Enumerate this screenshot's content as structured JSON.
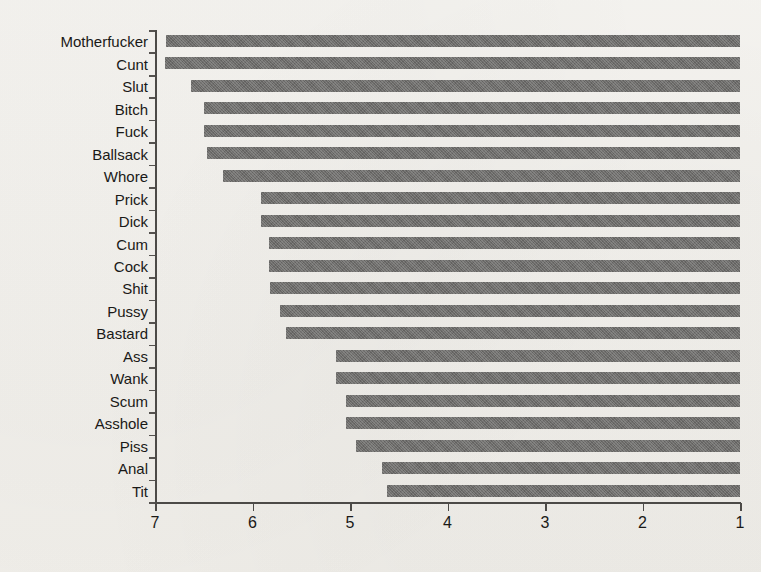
{
  "chart_data": {
    "type": "bar",
    "orientation": "horizontal",
    "title": "",
    "xlabel": "",
    "ylabel": "",
    "xlim": [
      7,
      1
    ],
    "x_ticks": [
      "7",
      "6",
      "5",
      "4",
      "3",
      "2",
      "1"
    ],
    "x_tick_values": [
      7,
      6,
      5,
      4,
      3,
      2,
      1
    ],
    "axis_reversed": true,
    "grid": false,
    "legend": false,
    "bar_baseline": 1,
    "categories": [
      "Motherfucker",
      "Cunt",
      "Slut",
      "Bitch",
      "Fuck",
      "Ballsack",
      "Whore",
      "Prick",
      "Dick",
      "Cum",
      "Cock",
      "Shit",
      "Pussy",
      "Bastard",
      "Ass",
      "Wank",
      "Scum",
      "Asshole",
      "Piss",
      "Anal",
      "Tit"
    ],
    "values": [
      6.89,
      6.9,
      6.63,
      6.5,
      6.5,
      6.47,
      6.3,
      5.91,
      5.91,
      5.83,
      5.83,
      5.82,
      5.72,
      5.66,
      5.14,
      5.14,
      5.04,
      5.04,
      4.94,
      4.67,
      4.62
    ],
    "colors": {
      "bar": "#6d6c6a",
      "axis": "#4c4a47",
      "text": "#1a1917",
      "background": "#f2f0eb"
    }
  }
}
